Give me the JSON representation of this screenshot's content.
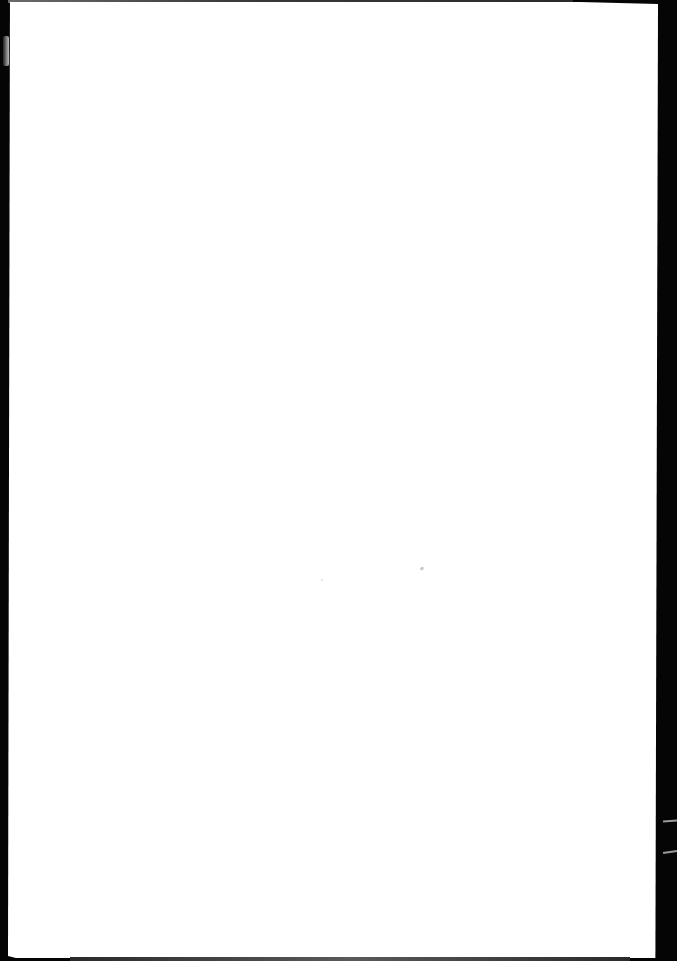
{
  "document": {
    "type": "blank scanned page",
    "text_content": [],
    "colors": {
      "paper": "#ffffff",
      "scanner_bed": "#050505",
      "edge_shadow": "#3a3a3a",
      "speck": "#c8c8c8"
    }
  }
}
